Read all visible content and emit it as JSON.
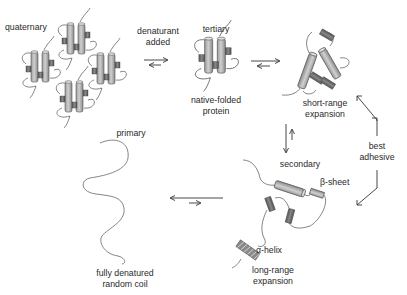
{
  "diagram": {
    "colors": {
      "helix_fill": "#b8b8b8",
      "sheet_fill": "#6e6e6e",
      "line": "#555555",
      "text": "#2a2a2a"
    },
    "nodes": [
      {
        "id": "quaternary",
        "label": "quaternary"
      },
      {
        "id": "tertiary",
        "label": "tertiary",
        "caption_line1": "native-folded",
        "caption_line2": "protein"
      },
      {
        "id": "short_range",
        "caption_line1": "short-range",
        "caption_line2": "expansion"
      },
      {
        "id": "secondary",
        "label": "secondary",
        "beta_label": "β-sheet",
        "alpha_label": "α-helix",
        "caption_line1": "long-range",
        "caption_line2": "expansion"
      },
      {
        "id": "primary",
        "label": "primary",
        "caption_line1": "fully denatured",
        "caption_line2": "random coil"
      }
    ],
    "arrows": [
      {
        "from": "quaternary",
        "to": "tertiary",
        "type": "equilibrium",
        "label_line1": "denaturant",
        "label_line2": "added"
      },
      {
        "from": "tertiary",
        "to": "short_range",
        "type": "equilibrium"
      },
      {
        "from": "short_range",
        "to": "secondary",
        "type": "equilibrium"
      },
      {
        "from": "secondary",
        "to": "primary",
        "type": "equilibrium"
      },
      {
        "from": "short_range",
        "to": "secondary",
        "type": "bidirectional",
        "label_line1": "best",
        "label_line2": "adhesive"
      }
    ]
  }
}
